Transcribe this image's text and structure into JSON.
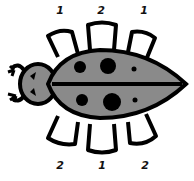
{
  "figure": {
    "body_color": "#8a8a8a",
    "outline_color": "#000000",
    "top_labels": [
      "1",
      "2",
      "1"
    ],
    "bottom_labels": [
      "2",
      "1",
      "2"
    ]
  }
}
